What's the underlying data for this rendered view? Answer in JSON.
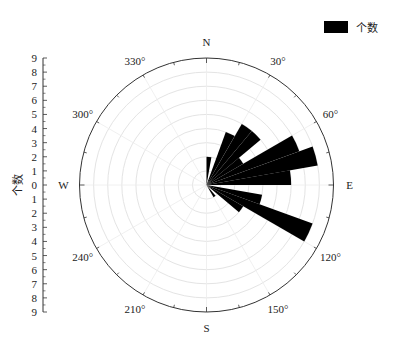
{
  "chart_data": {
    "type": "rose",
    "title": "",
    "legend": [
      {
        "label": "个数",
        "color": "#000000"
      }
    ],
    "legend_position": "top-right",
    "radial_axis": {
      "label": "个数",
      "min": 0,
      "max": 9,
      "ticks": [
        0,
        1,
        2,
        3,
        4,
        5,
        6,
        7,
        8,
        9
      ]
    },
    "angular_axis": {
      "direction": "clockwise",
      "zero": "N",
      "cardinal_labels": [
        "N",
        "E",
        "S",
        "W"
      ],
      "degree_labels": [
        "30°",
        "60°",
        "120°",
        "150°",
        "210°",
        "240°",
        "300°",
        "330°"
      ]
    },
    "grid": true,
    "bin_width_deg": 10,
    "bars": [
      {
        "angle": 5,
        "value": 2
      },
      {
        "angle": 25,
        "value": 4
      },
      {
        "angle": 35,
        "value": 5
      },
      {
        "angle": 45,
        "value": 5
      },
      {
        "angle": 55,
        "value": 3
      },
      {
        "angle": 65,
        "value": 7
      },
      {
        "angle": 75,
        "value": 8
      },
      {
        "angle": 85,
        "value": 6
      },
      {
        "angle": 105,
        "value": 4
      },
      {
        "angle": 115,
        "value": 8
      },
      {
        "angle": 125,
        "value": 3
      },
      {
        "angle": 145,
        "value": 1
      }
    ]
  },
  "legend_label": "个数",
  "axis_title": "个数"
}
